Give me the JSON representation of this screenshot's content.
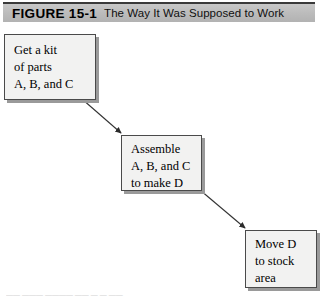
{
  "figure": {
    "number": "FIGURE 15-1",
    "title": "The Way It Was Supposed to Work",
    "banner_color": "#bdbdbd",
    "banner_border_color": "#3a3a3a"
  },
  "diagram": {
    "type": "flowchart",
    "box_fill": "#f2f2f1",
    "box_border": "#4a4a4a",
    "shadow_color": "#9a9a9a",
    "arrow_color": "#333333",
    "boxes": [
      {
        "id": "get-kit",
        "text": "Get a kit\nof parts\nA, B, and C"
      },
      {
        "id": "assemble",
        "text": "Assemble\nA, B, and C\nto make D"
      },
      {
        "id": "move",
        "text": "Move D\nto stock\narea"
      }
    ],
    "arrows": [
      {
        "id": "kit-to-assemble",
        "from": "get-kit",
        "to": "assemble"
      },
      {
        "id": "assemble-to-move",
        "from": "assemble",
        "to": "move"
      }
    ]
  },
  "footer": {
    "sliver_text": "―― ――― ―――― ―― ― ― ――"
  }
}
